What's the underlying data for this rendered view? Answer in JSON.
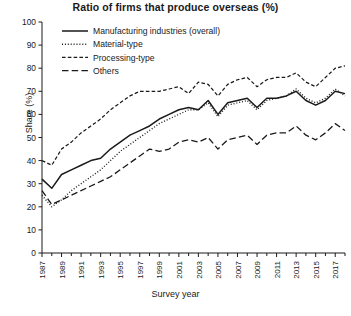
{
  "chart_data": {
    "type": "line",
    "title": "Ratio of firms that produce overseas (%)",
    "xlabel": "Survey year",
    "ylabel": "Share (%)",
    "ylim": [
      0,
      100
    ],
    "ytick_step": 10,
    "yticks": [
      0,
      10,
      20,
      30,
      40,
      50,
      60,
      70,
      80,
      90,
      100
    ],
    "xlim": [
      1987,
      2018
    ],
    "xticks": [
      1987,
      1989,
      1991,
      1993,
      1995,
      1997,
      1999,
      2001,
      2003,
      2005,
      2007,
      2009,
      2011,
      2013,
      2015,
      2017
    ],
    "xtick_labels": [
      "1987",
      "1989",
      "1991",
      "1993",
      "1995",
      "1997",
      "1999",
      "2001",
      "2003",
      "2005",
      "2007",
      "2009",
      "2011",
      "2013",
      "2015",
      "2017"
    ],
    "minor_xticks_every": 1,
    "grid": false,
    "legend_position": "top-center-inside",
    "x": [
      1987,
      1988,
      1989,
      1990,
      1991,
      1992,
      1993,
      1994,
      1995,
      1996,
      1997,
      1998,
      1999,
      2000,
      2001,
      2002,
      2003,
      2004,
      2005,
      2006,
      2007,
      2008,
      2009,
      2010,
      2011,
      2012,
      2013,
      2014,
      2015,
      2016,
      2017,
      2018
    ],
    "series": [
      {
        "name": "Manufacturing industries (overall)",
        "style": "solid",
        "values": [
          32,
          28,
          34,
          36,
          38,
          40,
          41,
          45,
          48,
          51,
          53,
          55,
          58,
          60,
          62,
          63,
          62,
          66,
          60,
          65,
          66,
          67,
          63,
          67,
          67,
          68,
          70,
          66,
          64,
          66,
          70,
          69
        ]
      },
      {
        "name": "Material-type",
        "style": "dotted",
        "values": [
          25,
          20,
          23,
          27,
          30,
          33,
          36,
          40,
          44,
          47,
          50,
          53,
          56,
          58,
          60,
          62,
          62,
          65,
          59,
          64,
          65,
          66,
          62,
          66,
          67,
          68,
          71,
          67,
          65,
          67,
          71,
          68
        ]
      },
      {
        "name": "Processing-type",
        "style": "short-dash",
        "values": [
          40,
          38,
          45,
          48,
          52,
          55,
          58,
          62,
          65,
          68,
          70,
          70,
          70,
          71,
          72,
          69,
          74,
          73,
          68,
          73,
          75,
          76,
          72,
          75,
          76,
          76,
          78,
          74,
          72,
          76,
          80,
          81
        ]
      },
      {
        "name": "Others",
        "style": "long-dash",
        "values": [
          27,
          21,
          23,
          25,
          27,
          29,
          31,
          33,
          36,
          39,
          42,
          45,
          44,
          45,
          48,
          49,
          48,
          50,
          45,
          49,
          50,
          51,
          47,
          51,
          52,
          52,
          55,
          51,
          49,
          52,
          56,
          53
        ]
      }
    ]
  },
  "axis": {
    "ylabel": "Share (%)",
    "xlabel": "Survey year"
  },
  "legend": {
    "items": [
      {
        "label": "Manufacturing industries (overall)",
        "style": "solid"
      },
      {
        "label": "Material-type",
        "style": "dotted"
      },
      {
        "label": "Processing-type",
        "style": "short-dash"
      },
      {
        "label": "Others",
        "style": "long-dash"
      }
    ]
  },
  "caption": ""
}
